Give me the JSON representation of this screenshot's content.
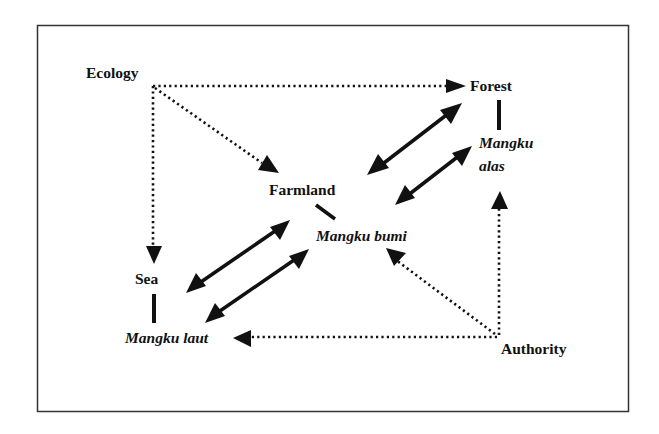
{
  "diagram": {
    "type": "concept-relationship-diagram",
    "colors": {
      "line": "#111111",
      "frame": "#333333",
      "background": "#ffffff"
    },
    "nodes": {
      "ecology": {
        "label": "Ecology",
        "style": "bold"
      },
      "forest": {
        "label": "Forest",
        "style": "bold"
      },
      "farmland": {
        "label": "Farmland",
        "style": "bold"
      },
      "sea": {
        "label": "Sea",
        "style": "bold"
      },
      "authority": {
        "label": "Authority",
        "style": "bold"
      },
      "mangku_alas": {
        "label_line1": "Mangku",
        "label_line2": "alas",
        "style": "bold-italic"
      },
      "mangku_bumi": {
        "label": "Mangku bumi",
        "style": "bold-italic"
      },
      "mangku_laut": {
        "label": "Mangku laut",
        "style": "bold-italic"
      }
    },
    "edges": [
      {
        "from": "Ecology",
        "to": "Forest",
        "style": "dotted",
        "direction": "forward"
      },
      {
        "from": "Ecology",
        "to": "Farmland",
        "style": "dotted",
        "direction": "forward"
      },
      {
        "from": "Ecology",
        "to": "Sea",
        "style": "dotted",
        "direction": "forward"
      },
      {
        "from": "Farmland",
        "to": "Forest",
        "style": "solid",
        "direction": "both"
      },
      {
        "from": "Mangku bumi",
        "to": "Mangku alas",
        "style": "solid",
        "direction": "both"
      },
      {
        "from": "Sea",
        "to": "Farmland",
        "style": "solid",
        "direction": "both"
      },
      {
        "from": "Mangku laut",
        "to": "Mangku bumi",
        "style": "solid",
        "direction": "both"
      },
      {
        "from": "Forest",
        "to": "Mangku alas",
        "style": "solid-bar",
        "direction": "none"
      },
      {
        "from": "Farmland",
        "to": "Mangku bumi",
        "style": "solid-bar",
        "direction": "none"
      },
      {
        "from": "Sea",
        "to": "Mangku laut",
        "style": "solid-bar",
        "direction": "none"
      },
      {
        "from": "Authority",
        "to": "Mangku laut",
        "style": "dotted",
        "direction": "forward"
      },
      {
        "from": "Authority",
        "to": "Mangku bumi",
        "style": "dotted",
        "direction": "forward"
      },
      {
        "from": "Authority",
        "to": "Mangku alas",
        "style": "dotted",
        "direction": "forward"
      }
    ]
  }
}
